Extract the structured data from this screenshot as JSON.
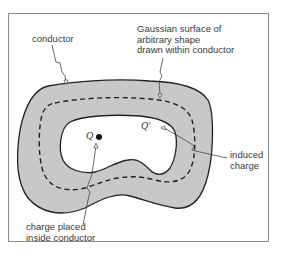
{
  "diagram": {
    "colors": {
      "conductor_fill": "#c8c8c8",
      "outline": "#222222",
      "frame": "#8a8a8a",
      "text": "#3a3a3a",
      "background": "#ffffff"
    },
    "labels": {
      "conductor": "conductor",
      "gaussian_surface": "Gaussian surface of\narbitrary shape\ndrawn within conductor",
      "induced_charge": "induced\ncharge",
      "charge_placed": "charge placed\ninside conductor"
    },
    "symbols": {
      "point_charge": "Q",
      "induced_charge": "Q'"
    }
  }
}
